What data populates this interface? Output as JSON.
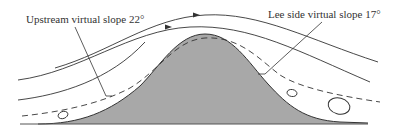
{
  "diagram": {
    "type": "airflow over hill cross-section",
    "labels": {
      "upstream": "Upstream virtual slope 22°",
      "lee": "Lee side virtual slope 17°"
    },
    "elements": {
      "hill": "shaded hill profile",
      "streamlines": 4,
      "streamline_arrows": 2,
      "dashed_virtual_slope_line": 1,
      "eddies": 3,
      "ground_line": 1
    },
    "colors": {
      "hill_fill": "#a8a8a8",
      "line": "#333333",
      "background": "#ffffff"
    }
  }
}
